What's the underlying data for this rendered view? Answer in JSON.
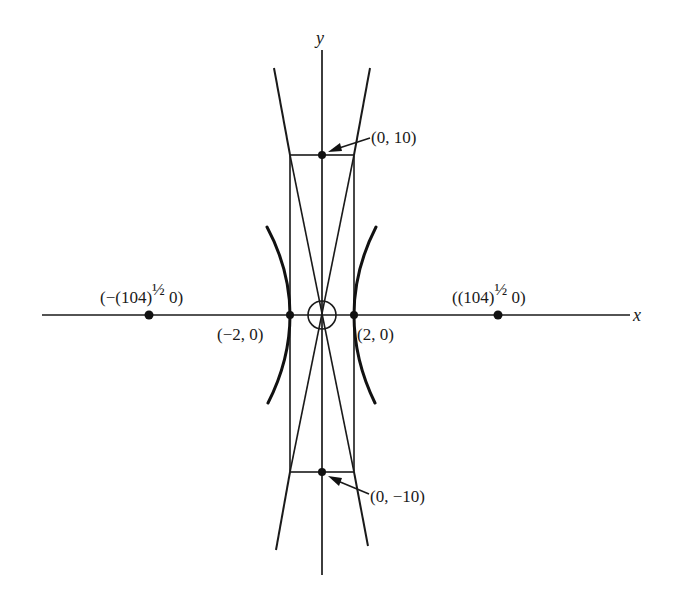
{
  "figure": {
    "axes": {
      "x_label": "x",
      "y_label": "y"
    },
    "points": {
      "left_focus": {
        "label_pre": "(−(104)",
        "label_sup": "½",
        "label_post": " 0)",
        "x": "-sqrt(104)",
        "y": 0
      },
      "right_focus": {
        "label_pre": "((104)",
        "label_sup": "½",
        "label_post": " 0)",
        "x": "sqrt(104)",
        "y": 0
      },
      "left_vertex": {
        "label": "(−2, 0)",
        "x": -2,
        "y": 0
      },
      "right_vertex": {
        "label": "(2, 0)",
        "x": 2,
        "y": 0
      },
      "top_covertex": {
        "label": "(0, 10)",
        "x": 0,
        "y": 10
      },
      "bottom_covertex": {
        "label": "(0, −10)",
        "x": 0,
        "y": -10
      }
    },
    "hyperbola": {
      "a": 2,
      "b": 10,
      "orientation": "horizontal transverse axis"
    },
    "asymptotes": [
      "y = 5x",
      "y = -5x"
    ],
    "rectangle": {
      "x_range": [
        -2,
        2
      ],
      "y_range": [
        -10,
        10
      ]
    },
    "center_marker": "small circle at origin",
    "colors": {
      "ink": "#1a1a1a",
      "background": "#ffffff"
    }
  }
}
